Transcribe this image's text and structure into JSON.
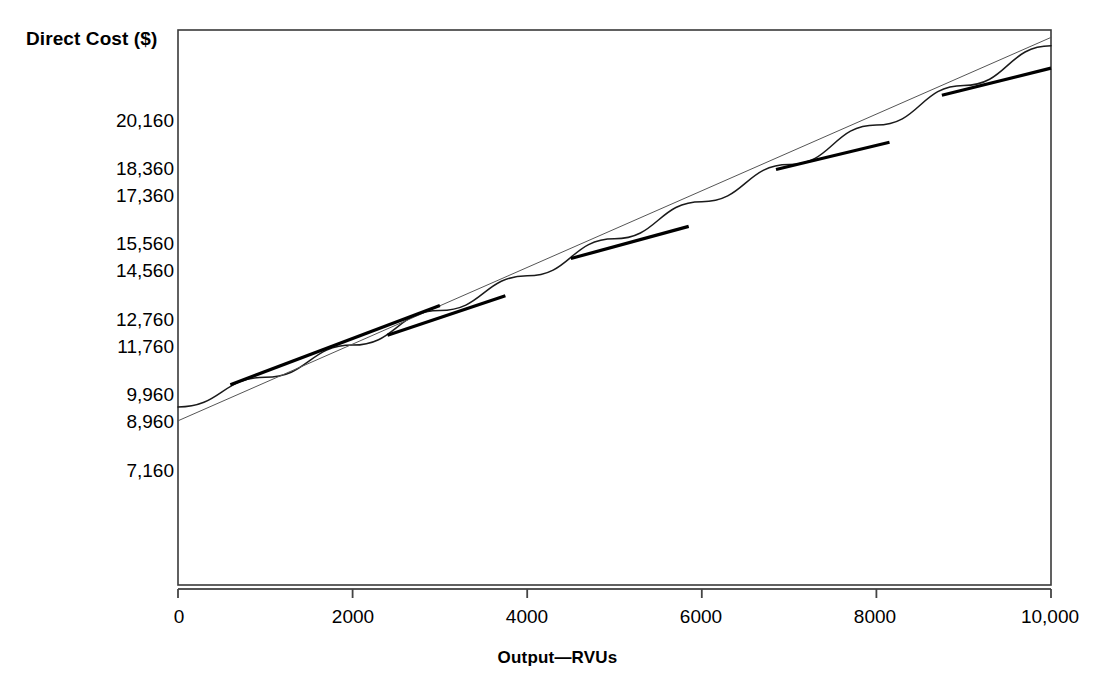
{
  "chart_data": {
    "type": "line",
    "title": "",
    "ylabel": "Direct Cost ($)",
    "xlabel": "Output—RVUs",
    "xlim": [
      0,
      10000
    ],
    "ylim": [
      0,
      22600
    ],
    "grid": false,
    "legend": null,
    "x_ticks": [
      {
        "value": 0,
        "label": "0"
      },
      {
        "value": 2000,
        "label": "2000"
      },
      {
        "value": 4000,
        "label": "4000"
      },
      {
        "value": 6000,
        "label": "6000"
      },
      {
        "value": 8000,
        "label": "8000"
      },
      {
        "value": 10000,
        "label": "10,000"
      }
    ],
    "y_ticks": [
      {
        "value": 20160,
        "label": "20,160"
      },
      {
        "value": 18360,
        "label": "18,360"
      },
      {
        "value": 17360,
        "label": "17,360"
      },
      {
        "value": 15560,
        "label": "15,560"
      },
      {
        "value": 14560,
        "label": "14,560"
      },
      {
        "value": 12760,
        "label": "12,760"
      },
      {
        "value": 11760,
        "label": "11,760"
      },
      {
        "value": 9960,
        "label": "9,960"
      },
      {
        "value": 8960,
        "label": "8,960"
      },
      {
        "value": 7160,
        "label": "7,160"
      }
    ],
    "series": [
      {
        "name": "total-direct-cost-curve",
        "style": "curve",
        "points": [
          {
            "x": 0,
            "y": 7360
          },
          {
            "x": 1000,
            "y": 8560
          },
          {
            "x": 2000,
            "y": 9860
          },
          {
            "x": 3000,
            "y": 11260
          },
          {
            "x": 4000,
            "y": 12660
          },
          {
            "x": 5000,
            "y": 14160
          },
          {
            "x": 6000,
            "y": 15660
          },
          {
            "x": 7000,
            "y": 17160
          },
          {
            "x": 8000,
            "y": 18760
          },
          {
            "x": 9000,
            "y": 20360
          },
          {
            "x": 10000,
            "y": 21960
          }
        ]
      },
      {
        "name": "straight-reference-line",
        "style": "thin-straight",
        "points": [
          {
            "x": 0,
            "y": 6800
          },
          {
            "x": 10000,
            "y": 22300
          }
        ]
      }
    ],
    "tangent_segments": [
      {
        "name": "tangent-1",
        "x0": 600,
        "y0": 8260,
        "x1": 3000,
        "y1": 11460
      },
      {
        "name": "tangent-2",
        "x0": 2400,
        "y0": 10260,
        "x1": 3750,
        "y1": 11860
      },
      {
        "name": "tangent-3",
        "x0": 4500,
        "y0": 13360,
        "x1": 5850,
        "y1": 14660
      },
      {
        "name": "tangent-4",
        "x0": 6850,
        "y0": 16960,
        "x1": 8150,
        "y1": 18060
      },
      {
        "name": "tangent-5",
        "x0": 8750,
        "y0": 19960,
        "x1": 10000,
        "y1": 21060
      }
    ],
    "colors": {
      "axis": "#444444",
      "curve": "#1a1a1a",
      "tangent": "#000000",
      "text": "#000000",
      "background": "#ffffff"
    }
  }
}
